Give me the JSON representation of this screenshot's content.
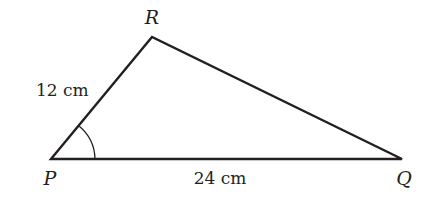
{
  "diagram": {
    "type": "triangle",
    "vertices": [
      {
        "name": "P",
        "label": "P",
        "x": 51,
        "y": 159
      },
      {
        "name": "R",
        "label": "R",
        "x": 152,
        "y": 37
      },
      {
        "name": "Q",
        "label": "Q",
        "x": 402,
        "y": 159
      }
    ],
    "sides": [
      {
        "between": "P-R",
        "label": "12 cm"
      },
      {
        "between": "P-Q",
        "label": "24 cm"
      }
    ],
    "angle_marker": {
      "at": "P",
      "arc": true
    },
    "colors": {
      "stroke": "#231f20",
      "background": "#ffffff"
    }
  }
}
